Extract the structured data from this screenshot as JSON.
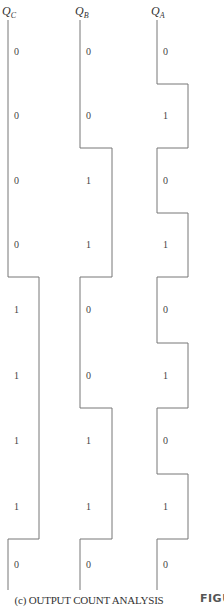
{
  "signals": [
    {
      "id": "qc",
      "name": "Q",
      "sub": "C",
      "title_x": 2,
      "low_x": 8,
      "high_x": 39,
      "bits": [
        "0",
        "0",
        "0",
        "0",
        "1",
        "1",
        "1",
        "1",
        "0"
      ]
    },
    {
      "id": "qb",
      "name": "Q",
      "sub": "B",
      "title_x": 75,
      "low_x": 80,
      "high_x": 112,
      "bits": [
        "0",
        "0",
        "1",
        "1",
        "0",
        "0",
        "1",
        "1",
        "0"
      ]
    },
    {
      "id": "qa",
      "name": "Q",
      "sub": "A",
      "title_x": 151,
      "low_x": 157,
      "high_x": 188,
      "bits": [
        "0",
        "1",
        "0",
        "1",
        "0",
        "1",
        "0",
        "1",
        "0"
      ]
    }
  ],
  "timing": {
    "top_y": 20,
    "bottom_y": 590,
    "edges_y": [
      20,
      84,
      148,
      213,
      277,
      343,
      408,
      474,
      539,
      590
    ]
  },
  "caption": "(c)  OUTPUT COUNT ANALYSIS",
  "figure_tag": "FIGU",
  "line_color": "#777777"
}
